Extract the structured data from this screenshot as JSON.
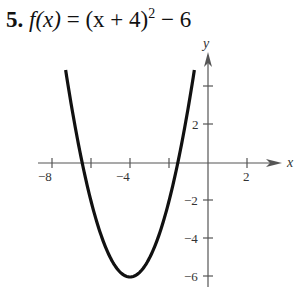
{
  "problem": {
    "number": "5.",
    "function_lhs": "f(x)",
    "equals": "=",
    "function_rhs_base": "(x + 4)",
    "exponent": "2",
    "function_rhs_tail": "− 6"
  },
  "chart_data": {
    "type": "line",
    "xlabel": "x",
    "ylabel": "y",
    "function": "(x+4)^2-6",
    "vertex": [
      -4,
      -6
    ],
    "x_range": [
      -7.3,
      -0.7
    ],
    "xlim": [
      -8.5,
      3.5
    ],
    "ylim": [
      -6.5,
      5.6
    ],
    "x_ticks": [
      -8,
      -6,
      -4,
      -2,
      2
    ],
    "x_tick_labels": [
      "-8",
      "-4",
      "2"
    ],
    "y_ticks": [
      -6,
      -4,
      -2,
      2,
      4
    ],
    "y_tick_labels": [
      "2",
      "-2",
      "-4",
      "-6"
    ],
    "grid": false,
    "series": [
      {
        "name": "f(x)",
        "x": [
          -7.3,
          -7,
          -6,
          -5,
          -4,
          -3,
          -2,
          -1,
          -0.7
        ],
        "y": [
          4.89,
          3,
          -2,
          -5,
          -6,
          -5,
          -2,
          3,
          4.89
        ]
      }
    ]
  },
  "labels": {
    "x_axis": "x",
    "y_axis": "y",
    "x_ticks": [
      "−8",
      "−4",
      "2"
    ],
    "y_ticks": [
      "2",
      "−2",
      "−4",
      "−6"
    ]
  }
}
